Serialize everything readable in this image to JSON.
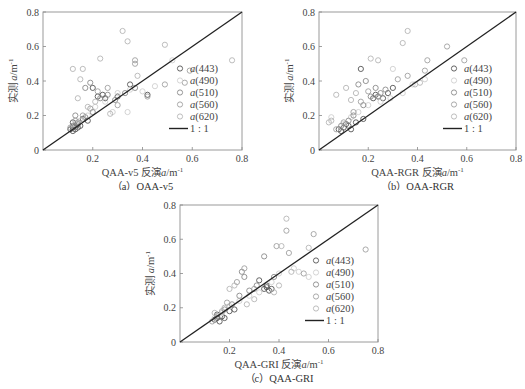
{
  "figure": {
    "panels": [
      {
        "id": "a",
        "caption": "（a）QAA-v5",
        "xlabel_prefix": "QAA-v5 反演",
        "ylabel": "实测 a/m⁻¹"
      },
      {
        "id": "b",
        "caption": "（b）QAA-RGR",
        "xlabel_prefix": "QAA-RGR 反演",
        "ylabel": "实测 a/m⁻¹"
      },
      {
        "id": "c",
        "caption": "（c）QAA-GRI",
        "xlabel_prefix": "QAA-GRI 反演",
        "ylabel": "实测 a/m⁻¹"
      }
    ],
    "legend": [
      "a(443)",
      "a(490)",
      "a(510)",
      "a(560)",
      "a(620)",
      "1 : 1"
    ]
  },
  "chart_data": [
    {
      "type": "scatter",
      "title": "(a) QAA-v5",
      "xlabel": "QAA-v5 反演a/m⁻¹",
      "ylabel": "实测 a/m⁻¹",
      "xlim": [
        0,
        0.8
      ],
      "ylim": [
        0,
        0.8
      ],
      "xticks": [
        0.2,
        0.4,
        0.6,
        0.8
      ],
      "yticks": [
        0,
        0.2,
        0.4,
        0.6,
        0.8
      ],
      "grid": false,
      "legend_position": "lower right",
      "reference_line": {
        "name": "1:1",
        "x": [
          0,
          0.8
        ],
        "y": [
          0,
          0.8
        ]
      },
      "series": [
        {
          "name": "a(443)",
          "color": "#555555",
          "points": [
            [
              0.12,
              0.13
            ],
            [
              0.13,
              0.14
            ],
            [
              0.11,
              0.12
            ],
            [
              0.14,
              0.15
            ],
            [
              0.12,
              0.16
            ],
            [
              0.13,
              0.12
            ],
            [
              0.15,
              0.14
            ],
            [
              0.18,
              0.17
            ],
            [
              0.2,
              0.36
            ],
            [
              0.22,
              0.31
            ],
            [
              0.24,
              0.32
            ],
            [
              0.25,
              0.3
            ],
            [
              0.3,
              0.31
            ],
            [
              0.35,
              0.38
            ],
            [
              0.42,
              0.32
            ],
            [
              0.14,
              0.13
            ],
            [
              0.16,
              0.18
            ],
            [
              0.12,
              0.11
            ]
          ]
        },
        {
          "name": "a(490)",
          "color": "#cfcfcf",
          "points": [
            [
              0.13,
              0.15
            ],
            [
              0.15,
              0.17
            ],
            [
              0.18,
              0.2
            ],
            [
              0.21,
              0.25
            ],
            [
              0.25,
              0.28
            ],
            [
              0.3,
              0.33
            ],
            [
              0.35,
              0.35
            ],
            [
              0.4,
              0.34
            ],
            [
              0.45,
              0.37
            ],
            [
              0.52,
              0.52
            ],
            [
              0.28,
              0.22
            ],
            [
              0.34,
              0.22
            ]
          ]
        },
        {
          "name": "a(510)",
          "color": "#8a8a8a",
          "points": [
            [
              0.12,
              0.14
            ],
            [
              0.14,
              0.16
            ],
            [
              0.17,
              0.19
            ],
            [
              0.2,
              0.22
            ],
            [
              0.23,
              0.3
            ],
            [
              0.26,
              0.32
            ],
            [
              0.29,
              0.29
            ],
            [
              0.33,
              0.33
            ],
            [
              0.37,
              0.36
            ],
            [
              0.17,
              0.36
            ],
            [
              0.19,
              0.39
            ],
            [
              0.13,
              0.2
            ]
          ]
        },
        {
          "name": "a(560)",
          "color": "#a0a0a0",
          "points": [
            [
              0.11,
              0.13
            ],
            [
              0.13,
              0.17
            ],
            [
              0.16,
              0.2
            ],
            [
              0.19,
              0.24
            ],
            [
              0.22,
              0.34
            ],
            [
              0.26,
              0.36
            ],
            [
              0.3,
              0.26
            ],
            [
              0.37,
              0.52
            ],
            [
              0.37,
              0.5
            ],
            [
              0.42,
              0.31
            ],
            [
              0.49,
              0.38
            ],
            [
              0.57,
              0.39
            ],
            [
              0.59,
              0.46
            ]
          ]
        },
        {
          "name": "a(620)",
          "color": "#b5b5b5",
          "points": [
            [
              0.12,
              0.47
            ],
            [
              0.16,
              0.47
            ],
            [
              0.15,
              0.41
            ],
            [
              0.23,
              0.53
            ],
            [
              0.32,
              0.69
            ],
            [
              0.34,
              0.63
            ],
            [
              0.49,
              0.61
            ],
            [
              0.76,
              0.52
            ],
            [
              0.14,
              0.3
            ],
            [
              0.18,
              0.25
            ],
            [
              0.21,
              0.28
            ],
            [
              0.27,
              0.21
            ],
            [
              0.38,
              0.43
            ]
          ]
        }
      ]
    },
    {
      "type": "scatter",
      "title": "(b) QAA-RGR",
      "xlabel": "QAA-RGR 反演a/m⁻¹",
      "ylabel": "实测 a/m⁻¹",
      "xlim": [
        0,
        0.8
      ],
      "ylim": [
        0,
        0.8
      ],
      "xticks": [
        0.2,
        0.4,
        0.6,
        0.8
      ],
      "yticks": [
        0,
        0.2,
        0.4,
        0.6,
        0.8
      ],
      "grid": false,
      "legend_position": "lower right",
      "reference_line": {
        "name": "1:1",
        "x": [
          0,
          0.8
        ],
        "y": [
          0,
          0.8
        ]
      },
      "series": [
        {
          "name": "a(443)",
          "color": "#555555",
          "points": [
            [
              0.08,
              0.12
            ],
            [
              0.1,
              0.13
            ],
            [
              0.12,
              0.14
            ],
            [
              0.09,
              0.11
            ],
            [
              0.11,
              0.15
            ],
            [
              0.13,
              0.12
            ],
            [
              0.15,
              0.16
            ],
            [
              0.18,
              0.18
            ],
            [
              0.22,
              0.3
            ],
            [
              0.24,
              0.31
            ],
            [
              0.26,
              0.3
            ],
            [
              0.23,
              0.32
            ],
            [
              0.28,
              0.33
            ],
            [
              0.17,
              0.47
            ],
            [
              0.3,
              0.36
            ]
          ]
        },
        {
          "name": "a(490)",
          "color": "#cfcfcf",
          "points": [
            [
              0.1,
              0.15
            ],
            [
              0.13,
              0.19
            ],
            [
              0.16,
              0.22
            ],
            [
              0.2,
              0.26
            ],
            [
              0.25,
              0.28
            ],
            [
              0.29,
              0.3
            ],
            [
              0.34,
              0.33
            ],
            [
              0.38,
              0.38
            ],
            [
              0.3,
              0.47
            ],
            [
              0.43,
              0.41
            ],
            [
              0.05,
              0.19
            ]
          ]
        },
        {
          "name": "a(510)",
          "color": "#8a8a8a",
          "points": [
            [
              0.09,
              0.14
            ],
            [
              0.12,
              0.17
            ],
            [
              0.14,
              0.2
            ],
            [
              0.18,
              0.26
            ],
            [
              0.21,
              0.31
            ],
            [
              0.25,
              0.33
            ],
            [
              0.19,
              0.4
            ],
            [
              0.16,
              0.38
            ],
            [
              0.23,
              0.36
            ],
            [
              0.27,
              0.35
            ]
          ]
        },
        {
          "name": "a(560)",
          "color": "#a0a0a0",
          "points": [
            [
              0.07,
              0.12
            ],
            [
              0.1,
              0.16
            ],
            [
              0.14,
              0.22
            ],
            [
              0.17,
              0.28
            ],
            [
              0.2,
              0.34
            ],
            [
              0.24,
              0.31
            ],
            [
              0.32,
              0.41
            ],
            [
              0.36,
              0.43
            ],
            [
              0.43,
              0.46
            ],
            [
              0.44,
              0.52
            ],
            [
              0.59,
              0.52
            ],
            [
              0.52,
              0.6
            ]
          ]
        },
        {
          "name": "a(620)",
          "color": "#b5b5b5",
          "points": [
            [
              0.04,
              0.16
            ],
            [
              0.07,
              0.32
            ],
            [
              0.11,
              0.36
            ],
            [
              0.13,
              0.29
            ],
            [
              0.15,
              0.33
            ],
            [
              0.21,
              0.53
            ],
            [
              0.24,
              0.52
            ],
            [
              0.34,
              0.62
            ],
            [
              0.36,
              0.69
            ],
            [
              0.39,
              0.38
            ],
            [
              0.41,
              0.39
            ],
            [
              0.05,
              0.17
            ]
          ]
        }
      ]
    },
    {
      "type": "scatter",
      "title": "(c) QAA-GRI",
      "xlabel": "QAA-GRI 反演a/m⁻¹",
      "ylabel": "实测 a/m⁻¹",
      "xlim": [
        0,
        0.8
      ],
      "ylim": [
        0,
        0.8
      ],
      "xticks": [
        0.2,
        0.4,
        0.6,
        0.8
      ],
      "yticks": [
        0,
        0.2,
        0.4,
        0.6,
        0.8
      ],
      "grid": false,
      "legend_position": "lower right",
      "reference_line": {
        "name": "1:1",
        "x": [
          0,
          0.8
        ],
        "y": [
          0,
          0.8
        ]
      },
      "series": [
        {
          "name": "a(443)",
          "color": "#555555",
          "points": [
            [
              0.14,
              0.13
            ],
            [
              0.15,
              0.14
            ],
            [
              0.16,
              0.12
            ],
            [
              0.17,
              0.15
            ],
            [
              0.15,
              0.16
            ],
            [
              0.18,
              0.14
            ],
            [
              0.2,
              0.18
            ],
            [
              0.22,
              0.19
            ],
            [
              0.34,
              0.31
            ],
            [
              0.35,
              0.32
            ],
            [
              0.36,
              0.3
            ],
            [
              0.35,
              0.33
            ],
            [
              0.37,
              0.31
            ],
            [
              0.32,
              0.36
            ]
          ]
        },
        {
          "name": "a(490)",
          "color": "#cfcfcf",
          "points": [
            [
              0.14,
              0.14
            ],
            [
              0.17,
              0.17
            ],
            [
              0.2,
              0.21
            ],
            [
              0.24,
              0.24
            ],
            [
              0.28,
              0.27
            ],
            [
              0.32,
              0.29
            ],
            [
              0.37,
              0.35
            ],
            [
              0.4,
              0.4
            ],
            [
              0.46,
              0.43
            ],
            [
              0.48,
              0.41
            ],
            [
              0.52,
              0.38
            ]
          ]
        },
        {
          "name": "a(510)",
          "color": "#8a8a8a",
          "points": [
            [
              0.15,
              0.15
            ],
            [
              0.18,
              0.19
            ],
            [
              0.21,
              0.22
            ],
            [
              0.24,
              0.27
            ],
            [
              0.26,
              0.38
            ],
            [
              0.25,
              0.41
            ],
            [
              0.28,
              0.3
            ],
            [
              0.31,
              0.33
            ],
            [
              0.38,
              0.38
            ],
            [
              0.34,
              0.5
            ]
          ]
        },
        {
          "name": "a(560)",
          "color": "#a0a0a0",
          "points": [
            [
              0.13,
              0.12
            ],
            [
              0.17,
              0.18
            ],
            [
              0.19,
              0.23
            ],
            [
              0.23,
              0.35
            ],
            [
              0.26,
              0.43
            ],
            [
              0.3,
              0.31
            ],
            [
              0.39,
              0.56
            ],
            [
              0.43,
              0.65
            ],
            [
              0.44,
              0.52
            ],
            [
              0.5,
              0.4
            ],
            [
              0.54,
              0.63
            ],
            [
              0.75,
              0.54
            ]
          ]
        },
        {
          "name": "a(620)",
          "color": "#b5b5b5",
          "points": [
            [
              0.14,
              0.17
            ],
            [
              0.18,
              0.2
            ],
            [
              0.2,
              0.31
            ],
            [
              0.22,
              0.33
            ],
            [
              0.27,
              0.22
            ],
            [
              0.3,
              0.25
            ],
            [
              0.38,
              0.29
            ],
            [
              0.41,
              0.56
            ],
            [
              0.43,
              0.72
            ],
            [
              0.45,
              0.41
            ],
            [
              0.52,
              0.55
            ],
            [
              0.4,
              0.33
            ]
          ]
        }
      ]
    }
  ]
}
